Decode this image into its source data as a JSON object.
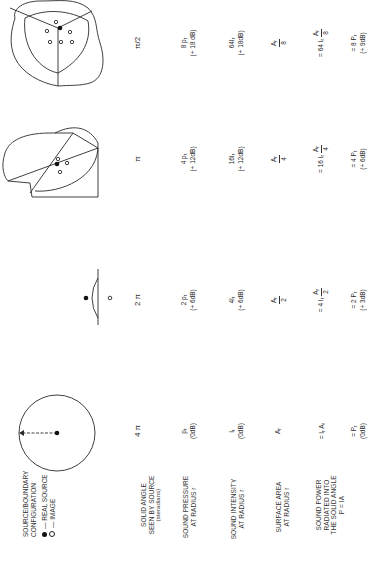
{
  "legend": {
    "title_line1": "SOURCE/BOUNDARY",
    "title_line2": "CONFIGURATION",
    "real_source": "— REAL SOURCE",
    "image": "— IMAGE"
  },
  "row_labels": {
    "solid_angle": [
      "SOLID ANGLE",
      "SEEN BY SOURCE",
      "(steradians)"
    ],
    "sound_pressure": [
      "SOUND PRESSURE",
      "AT RADIUS r"
    ],
    "sound_intensity": [
      "SOUND INTENSITY",
      "AT RADIUS r"
    ],
    "surface_area": [
      "SURFACE AREA",
      "AT RADIUS r"
    ],
    "sound_power": [
      "SOUND POWER",
      "RADIATED INTO",
      "THE SOLID ANGLE",
      "P = IA"
    ]
  },
  "columns": [
    {
      "configuration": "free-field",
      "diagram_label": "r",
      "solid_angle": "4 π",
      "pressure": "p",
      "pressure_sub": "r",
      "pressure_prefix": "",
      "pressure_db": "(0dB)",
      "intensity_prefix": "",
      "intensity": "I",
      "intensity_sub": "r",
      "intensity_db": "(0dB)",
      "area": "A",
      "area_sub": "r",
      "area_den": "",
      "power_prefix": "= I",
      "power_mid": " A",
      "power_den": "",
      "power2": "= P",
      "power2_sub": "r",
      "power2_prefix": "",
      "power_db": "(0dB)"
    },
    {
      "configuration": "one-boundary",
      "solid_angle": "2 π",
      "pressure_prefix": "2 ",
      "pressure": "p",
      "pressure_sub": "r",
      "pressure_db": "(+ 6dB)",
      "intensity_prefix": "4",
      "intensity": "I",
      "intensity_sub": "r",
      "intensity_db": "(+ 6dB)",
      "area": "A",
      "area_sub": "r",
      "area_den": "2",
      "power_prefix": "= 4 I",
      "power_mid": " A",
      "power_den": "2",
      "power2_prefix": "= 2 ",
      "power2": "P",
      "power2_sub": "r",
      "power_db": "(+ 3dB)"
    },
    {
      "configuration": "two-boundaries",
      "solid_angle": "π",
      "pressure_prefix": "4 ",
      "pressure": "p",
      "pressure_sub": "r",
      "pressure_db": "(+ 12dB)",
      "intensity_prefix": "16",
      "intensity": "I",
      "intensity_sub": "r",
      "intensity_db": "(+ 12dB)",
      "area": "A",
      "area_sub": "r",
      "area_den": "4",
      "power_prefix": "= 16 I",
      "power_mid": "A",
      "power_den": "4",
      "power2_prefix": "= 4 ",
      "power2": "P",
      "power2_sub": "r",
      "power_db": "(+ 6dB)"
    },
    {
      "configuration": "three-boundaries",
      "solid_angle": "π/2",
      "pressure_prefix": "8 ",
      "pressure": "p",
      "pressure_sub": "r",
      "pressure_db": "(+ 18 dB)",
      "intensity_prefix": "64",
      "intensity": "I",
      "intensity_sub": "r",
      "intensity_db": "(+ 18dB)",
      "area": "A",
      "area_sub": "r",
      "area_den": "8",
      "power_prefix": "= 64 I",
      "power_mid": "A",
      "power_den": "8",
      "power2_prefix": "= 8 ",
      "power2": "P",
      "power2_sub": "r",
      "power_db": "(+ 9dB)"
    }
  ]
}
